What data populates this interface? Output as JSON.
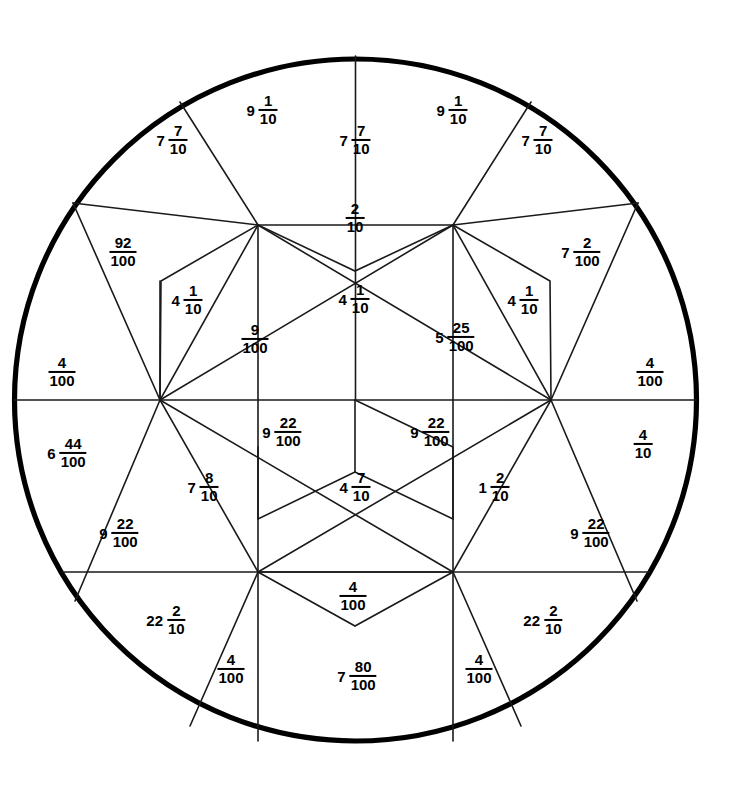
{
  "figure": {
    "background_color": "#ffffff",
    "line_color": "#1a1a1a",
    "outline_color": "#000000",
    "circle": {
      "cx": 355.5,
      "cy": 400,
      "r": 341
    }
  },
  "labels": [
    {
      "id": "lbl-9-1-10-top-left",
      "whole": "9",
      "num": "1",
      "den": "10",
      "x": 262,
      "y": 110
    },
    {
      "id": "lbl-9-1-10-top-right",
      "whole": "9",
      "num": "1",
      "den": "10",
      "x": 452,
      "y": 110
    },
    {
      "id": "lbl-7-7-10-upper-left",
      "whole": "7",
      "num": "7",
      "den": "10",
      "x": 172,
      "y": 140
    },
    {
      "id": "lbl-7-7-10-top-center",
      "whole": "7",
      "num": "7",
      "den": "10",
      "x": 355,
      "y": 140
    },
    {
      "id": "lbl-7-7-10-upper-right",
      "whole": "7",
      "num": "7",
      "den": "10",
      "x": 537,
      "y": 140
    },
    {
      "id": "lbl-92-100",
      "whole": "",
      "num": "92",
      "den": "100",
      "x": 123,
      "y": 252
    },
    {
      "id": "lbl-2-10-top-rhombus",
      "whole": "",
      "num": "2",
      "den": "10",
      "x": 355,
      "y": 218
    },
    {
      "id": "lbl-7-2-100",
      "whole": "7",
      "num": "2",
      "den": "100",
      "x": 581,
      "y": 252
    },
    {
      "id": "lbl-4-1-10-left",
      "whole": "4",
      "num": "1",
      "den": "10",
      "x": 187,
      "y": 300
    },
    {
      "id": "lbl-4-1-10-center",
      "whole": "4",
      "num": "1",
      "den": "10",
      "x": 354,
      "y": 299
    },
    {
      "id": "lbl-4-1-10-right",
      "whole": "4",
      "num": "1",
      "den": "10",
      "x": 523,
      "y": 300
    },
    {
      "id": "lbl-9-100",
      "whole": "",
      "num": "9",
      "den": "100",
      "x": 255,
      "y": 339
    },
    {
      "id": "lbl-5-25-100",
      "whole": "5",
      "num": "25",
      "den": "100",
      "x": 455,
      "y": 337
    },
    {
      "id": "lbl-4-100-left-edge",
      "whole": "",
      "num": "4",
      "den": "100",
      "x": 62,
      "y": 372
    },
    {
      "id": "lbl-4-100-right-edge",
      "whole": "",
      "num": "4",
      "den": "100",
      "x": 650,
      "y": 372
    },
    {
      "id": "lbl-6-44-100",
      "whole": "6",
      "num": "44",
      "den": "100",
      "x": 67,
      "y": 453
    },
    {
      "id": "lbl-9-22-100-upper-left",
      "whole": "9",
      "num": "22",
      "den": "100",
      "x": 282,
      "y": 432
    },
    {
      "id": "lbl-9-22-100-upper-right",
      "whole": "9",
      "num": "22",
      "den": "100",
      "x": 430,
      "y": 432
    },
    {
      "id": "lbl-4-10-right",
      "whole": "",
      "num": "4",
      "den": "10",
      "x": 643,
      "y": 444
    },
    {
      "id": "lbl-7-8-10",
      "whole": "7",
      "num": "8",
      "den": "10",
      "x": 203,
      "y": 487
    },
    {
      "id": "lbl-4-7-10",
      "whole": "4",
      "num": "7",
      "den": "10",
      "x": 355,
      "y": 487
    },
    {
      "id": "lbl-1-2-10",
      "whole": "1",
      "num": "2",
      "den": "10",
      "x": 494,
      "y": 487
    },
    {
      "id": "lbl-9-22-100-lower-left",
      "whole": "9",
      "num": "22",
      "den": "100",
      "x": 119,
      "y": 533
    },
    {
      "id": "lbl-9-22-100-lower-right",
      "whole": "9",
      "num": "22",
      "den": "100",
      "x": 590,
      "y": 533
    },
    {
      "id": "lbl-4-100-bottom-center",
      "whole": "",
      "num": "4",
      "den": "100",
      "x": 353,
      "y": 596
    },
    {
      "id": "lbl-22-2-10-left",
      "whole": "22",
      "num": "2",
      "den": "10",
      "x": 166,
      "y": 620
    },
    {
      "id": "lbl-22-2-10-right",
      "whole": "22",
      "num": "2",
      "den": "10",
      "x": 543,
      "y": 620
    },
    {
      "id": "lbl-4-100-bottom-left",
      "whole": "",
      "num": "4",
      "den": "100",
      "x": 231,
      "y": 669
    },
    {
      "id": "lbl-7-80-100",
      "whole": "7",
      "num": "80",
      "den": "100",
      "x": 357,
      "y": 676
    },
    {
      "id": "lbl-4-100-bottom-right",
      "whole": "",
      "num": "4",
      "den": "100",
      "x": 479,
      "y": 669
    }
  ],
  "paths": {
    "horizontal_diameter": "M 14.5 400 L 696.5 400",
    "vertical_lower": "M 258 572 L 258 740",
    "vertical_lower_right": "M 453 572 L 453 740",
    "lower_chord": "M 62 572 L 649 572",
    "hexagon": "M 258 225 L 453 225 L 551 400 L 453 572 L 258 572 L 160 400 Z",
    "spokes_center": "M 160 400 L 258 225 M 453 225 L 551 400 M 160 400 L 453 225 M 258 225 L 551 400 M 258 572 L 551 400 M 160 400 L 453 572 M 258 225 L 258 572 M 453 225 L 453 572",
    "top_rhombus": "M 258 225 L 355 271 L 453 225",
    "bottom_rhombus": "M 258 572 L 355 626 L 453 572",
    "left_parallelogram": "M 355 400 L 355 472 L 258 519 L 258 447",
    "right_parallelogram": "M 355 400 L 453 447 L 453 519 L 355 472",
    "upper_left_quad": "M 160 400 L 161 281 L 258 225",
    "upper_right_quad": "M 551 400 L 550 281 L 453 225",
    "outer_spokes": "M 355.5 400 L 355.5 56 M 355.5 400 L 180 102 M 355.5 400 L 531 102 M 355.5 400 L 73 203 M 355.5 400 L 638 203 M 355.5 400 L 75 601 M 355.5 400 L 637 601 M 355.5 400 L 190 726 M 355.5 400 L 521 726",
    "outer_chord_upper_left": "M 73 203 L 160 400",
    "outer_chord_upper_right": "M 638 203 L 551 400",
    "outer_chord_lower_left": "M 75 601 L 160 400",
    "outer_chord_lower_right": "M 637 601 L 551 400"
  }
}
